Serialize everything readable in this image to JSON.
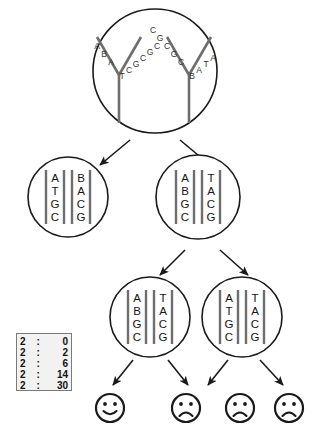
{
  "diagram": {
    "colors": {
      "stroke": "#1a1a1a",
      "letter": "#333333",
      "strand": "#6e6e6e",
      "legend_bg": "#f2f2f0",
      "legend_border": "#7a7a7a"
    },
    "cells": [
      {
        "id": "cell-root",
        "level": 0,
        "cx": 155,
        "cy": 71,
        "r": 62,
        "type": "replication-fork",
        "forks": [
          {
            "id": "fork-left",
            "left_arm_letters": [
              "A",
              "B",
              "A"
            ],
            "right_arm_letters": [
              "T",
              "C",
              "G",
              "C",
              "G",
              "C"
            ]
          },
          {
            "id": "fork-right",
            "left_arm_letters": [
              "C",
              "G",
              "C",
              "G",
              "C"
            ],
            "right_arm_letters": [
              "B",
              "A",
              "T",
              "A"
            ]
          }
        ]
      },
      {
        "id": "cell-l1-left",
        "level": 1,
        "cx": 68,
        "cy": 197,
        "r": 40,
        "type": "daughter-cell",
        "strand_left": [
          "A",
          "T",
          "G",
          "C"
        ],
        "strand_right": [
          "B",
          "A",
          "C",
          "G"
        ]
      },
      {
        "id": "cell-l1-right",
        "level": 1,
        "cx": 198,
        "cy": 197,
        "r": 42,
        "type": "daughter-cell",
        "strand_left": [
          "A",
          "B",
          "G",
          "C"
        ],
        "strand_right": [
          "T",
          "A",
          "C",
          "G"
        ]
      },
      {
        "id": "cell-l2-left",
        "level": 2,
        "cx": 150,
        "cy": 317,
        "r": 40,
        "type": "daughter-cell",
        "strand_left": [
          "A",
          "B",
          "G",
          "C"
        ],
        "strand_right": [
          "T",
          "A",
          "C",
          "G"
        ]
      },
      {
        "id": "cell-l2-right",
        "level": 2,
        "cx": 242,
        "cy": 317,
        "r": 40,
        "type": "daughter-cell",
        "strand_left": [
          "A",
          "T",
          "G",
          "C"
        ],
        "strand_right": [
          "T",
          "A",
          "C",
          "G"
        ]
      }
    ],
    "arrows": [
      {
        "id": "arrow-root-to-l1-left",
        "x1": 130,
        "y1": 140,
        "x2": 100,
        "y2": 165
      },
      {
        "id": "arrow-root-to-l1-right",
        "x1": 180,
        "y1": 140,
        "x2": 210,
        "y2": 165
      },
      {
        "id": "arrow-l1r-to-l2-left",
        "x1": 185,
        "y1": 250,
        "x2": 160,
        "y2": 275
      },
      {
        "id": "arrow-l1r-to-l2-right",
        "x1": 220,
        "y1": 250,
        "x2": 248,
        "y2": 275
      },
      {
        "id": "arrow-l2l-to-face-1",
        "x1": 133,
        "y1": 360,
        "x2": 113,
        "y2": 385
      },
      {
        "id": "arrow-l2l-to-face-2",
        "x1": 168,
        "y1": 360,
        "x2": 188,
        "y2": 385
      },
      {
        "id": "arrow-l2r-to-face-3",
        "x1": 228,
        "y1": 360,
        "x2": 208,
        "y2": 385
      },
      {
        "id": "arrow-l2r-to-face-4",
        "x1": 260,
        "y1": 360,
        "x2": 283,
        "y2": 385
      }
    ],
    "faces": [
      {
        "id": "face-1",
        "mood": "happy",
        "cx": 110,
        "cy": 408,
        "r": 14
      },
      {
        "id": "face-2",
        "mood": "sad",
        "cx": 186,
        "cy": 408,
        "r": 14
      },
      {
        "id": "face-3",
        "mood": "sad",
        "cx": 240,
        "cy": 408,
        "r": 14
      },
      {
        "id": "face-4",
        "mood": "sad",
        "cx": 289,
        "cy": 408,
        "r": 14
      }
    ]
  },
  "legend": {
    "name": "generation-error-legend",
    "separator": ":",
    "rows": [
      {
        "left": "2",
        "right": "0"
      },
      {
        "left": "2",
        "right": "2"
      },
      {
        "left": "2",
        "right": "6"
      },
      {
        "left": "2",
        "right": "14"
      },
      {
        "left": "2",
        "right": "30"
      }
    ]
  }
}
